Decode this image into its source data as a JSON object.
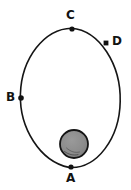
{
  "figure": {
    "kind": "orbit-diagram",
    "background_color": "#ffffff",
    "ink_color": "#151515"
  },
  "orbit": {
    "name": "elliptical-orbit-path",
    "center_x": 70,
    "center_y": 98,
    "radius_x": 50,
    "radius_y": 70,
    "stroke_color": "#151515",
    "stroke_width": 1.6,
    "fill": "none"
  },
  "central_body": {
    "label": "",
    "center_x": 74,
    "center_y": 144,
    "radius": 14,
    "fill_color": "#8c8c8c",
    "stroke_color": "#141414",
    "stroke_width": 1.8
  },
  "points": [
    {
      "id": "A",
      "label": "A",
      "marker_x": 71,
      "marker_y": 167,
      "marker_radius": 2.6,
      "marker_shape": "dot",
      "label_x": 66,
      "label_y": 172,
      "label_position": "below"
    },
    {
      "id": "B",
      "label": "B",
      "marker_x": 21,
      "marker_y": 98,
      "marker_radius": 2.8,
      "marker_shape": "dot",
      "label_x": 6,
      "label_y": 91,
      "label_position": "left"
    },
    {
      "id": "C",
      "label": "C",
      "marker_x": 72,
      "marker_y": 29,
      "marker_radius": 2.6,
      "marker_shape": "dot",
      "label_x": 66,
      "label_y": 9,
      "label_position": "above"
    },
    {
      "id": "D",
      "label": "D",
      "marker_x": 106,
      "marker_y": 43,
      "marker_radius": 2.6,
      "marker_shape": "square",
      "label_x": 112,
      "label_y": 35,
      "label_position": "right"
    }
  ],
  "chart_data": {
    "type": "scatter",
    "title": "",
    "xlabel": "",
    "ylabel": "",
    "categories": [
      "A",
      "B",
      "C",
      "D"
    ],
    "series": [
      {
        "name": "orbit positions",
        "points": [
          {
            "label": "A",
            "x": 71,
            "y": 167
          },
          {
            "label": "B",
            "x": 21,
            "y": 98
          },
          {
            "label": "C",
            "x": 72,
            "y": 29
          },
          {
            "label": "D",
            "x": 106,
            "y": 43
          }
        ]
      }
    ],
    "xlim": [
      0,
      131
    ],
    "ylim": [
      0,
      190
    ],
    "grid": false,
    "legend": "none"
  }
}
